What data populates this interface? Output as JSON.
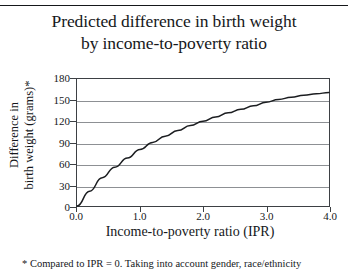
{
  "title": {
    "line1": "Predicted difference in birth weight",
    "line2": "by income-to-poverty ratio"
  },
  "yaxis": {
    "title_line1": "Difference in",
    "title_line2": "birth weight (grams)*"
  },
  "xaxis": {
    "title": "Income-to-poverty ratio (IPR)"
  },
  "footnote": {
    "text": "* Compared to IPR = 0. Taking into account gender, race/ethnicity"
  },
  "colors": {
    "curve": "#1b1d20",
    "gridline": "#8d9094",
    "frame": "#3d4044",
    "text": "#16181b",
    "background": "#ffffff"
  },
  "chart_data": {
    "type": "line",
    "title": "Predicted difference in birth weight by income-to-poverty ratio",
    "xlabel": "Income-to-poverty ratio (IPR)",
    "ylabel": "Difference in birth weight (grams)*",
    "xlim": [
      0.0,
      4.0
    ],
    "ylim": [
      0,
      180
    ],
    "xticks": [
      0.0,
      1.0,
      2.0,
      3.0,
      4.0
    ],
    "xticklabels": [
      "0.0",
      "1.0",
      "2.0",
      "3.0",
      "4.0"
    ],
    "yticks": [
      0,
      30,
      60,
      90,
      120,
      150,
      180
    ],
    "yticklabels": [
      "0",
      "30",
      "60",
      "90",
      "120",
      "150",
      "180"
    ],
    "grid": "horizontal",
    "legend": null,
    "series": [
      {
        "name": "Predicted difference in birth weight",
        "x": [
          0.0,
          0.2,
          0.4,
          0.6,
          0.8,
          1.0,
          1.2,
          1.4,
          1.6,
          1.8,
          2.0,
          2.2,
          2.4,
          2.6,
          2.8,
          3.0,
          3.2,
          3.4,
          3.6,
          3.8,
          4.0
        ],
        "values": [
          0,
          21,
          40,
          55,
          68,
          80,
          90,
          99,
          107,
          114,
          120,
          126,
          132,
          137,
          142,
          147,
          151,
          154,
          157,
          159,
          161
        ]
      }
    ],
    "annotations": [
      "* Compared to IPR = 0. Taking into account gender, race/ethnicity"
    ]
  }
}
